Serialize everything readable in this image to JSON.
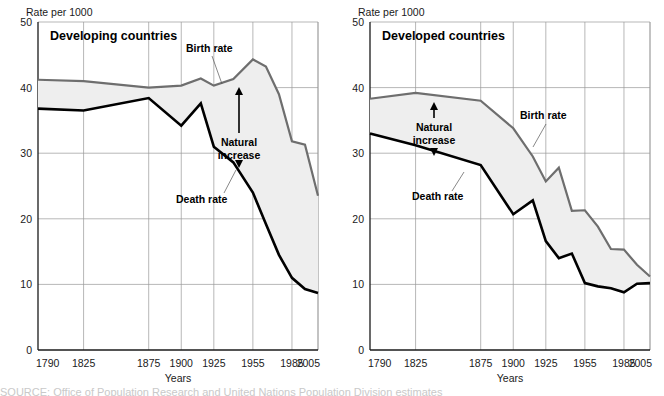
{
  "figure": {
    "background_color": "#ffffff",
    "birth_color": "#6e6e6e",
    "death_color": "#000000",
    "fill_color": "#eeeeee",
    "grid_color": "#9a9a9a",
    "axis_color": "#1a1a1a"
  },
  "chart_data": [
    {
      "type": "line",
      "panel_id": "developing",
      "title": "Developing countries",
      "ylabel": "Rate per 1000",
      "xlabel": "Years",
      "ylim": [
        0,
        50
      ],
      "yticks": [
        0,
        10,
        20,
        30,
        40,
        50
      ],
      "ytick_labels": [
        "0",
        "10",
        "20",
        "30",
        "40",
        "50"
      ],
      "xticks": [
        1790,
        1825,
        1875,
        1900,
        1925,
        1955,
        1985,
        2005
      ],
      "xtick_labels": [
        "1790",
        "1825",
        "1875",
        "1900",
        "1925",
        "1955",
        "1985",
        "2005"
      ],
      "xlim": [
        1790,
        2005
      ],
      "grid": true,
      "legend_position": "inline-annotations",
      "annotations": [
        {
          "name": "birth-rate-label",
          "text": "Birth rate"
        },
        {
          "name": "death-rate-label",
          "text": "Death rate"
        },
        {
          "name": "natural-increase-label",
          "text": "Natural\nincrease"
        }
      ],
      "series": [
        {
          "name": "Birth rate",
          "color": "#6e6e6e",
          "x": [
            1790,
            1825,
            1875,
            1900,
            1915,
            1925,
            1940,
            1955,
            1965,
            1975,
            1985,
            1995,
            2005
          ],
          "values": [
            41.2,
            41.0,
            40.0,
            40.3,
            41.4,
            40.3,
            41.3,
            44.3,
            43.2,
            39.0,
            31.8,
            31.3,
            23.5
          ]
        },
        {
          "name": "Death rate",
          "color": "#000000",
          "x": [
            1790,
            1825,
            1875,
            1900,
            1915,
            1925,
            1940,
            1955,
            1965,
            1975,
            1985,
            1995,
            2005
          ],
          "values": [
            36.8,
            36.5,
            38.4,
            34.2,
            37.6,
            31.0,
            28.6,
            24.0,
            19.2,
            14.5,
            11.0,
            9.3,
            8.7
          ]
        }
      ]
    },
    {
      "type": "line",
      "panel_id": "developed",
      "title": "Developed countries",
      "ylabel": "Rate per 1000",
      "xlabel": "Years",
      "ylim": [
        0,
        50
      ],
      "yticks": [
        0,
        10,
        20,
        30,
        40,
        50
      ],
      "ytick_labels": [
        "0",
        "10",
        "20",
        "30",
        "40",
        "50"
      ],
      "xticks": [
        1790,
        1825,
        1875,
        1900,
        1925,
        1955,
        1985,
        2005
      ],
      "xtick_labels": [
        "1790",
        "1825",
        "1875",
        "1900",
        "1925",
        "1955",
        "1985",
        "2005"
      ],
      "xlim": [
        1790,
        2005
      ],
      "grid": true,
      "legend_position": "inline-annotations",
      "annotations": [
        {
          "name": "birth-rate-label",
          "text": "Birth rate"
        },
        {
          "name": "death-rate-label",
          "text": "Death rate"
        },
        {
          "name": "natural-increase-label",
          "text": "Natural\nincrease"
        }
      ],
      "series": [
        {
          "name": "Birth rate",
          "color": "#6e6e6e",
          "x": [
            1790,
            1825,
            1875,
            1900,
            1915,
            1925,
            1935,
            1945,
            1955,
            1965,
            1975,
            1985,
            1995,
            2005
          ],
          "values": [
            38.3,
            39.2,
            38.0,
            33.8,
            29.5,
            25.7,
            27.8,
            21.2,
            21.3,
            18.8,
            15.4,
            15.3,
            13.0,
            11.2
          ]
        },
        {
          "name": "Death rate",
          "color": "#000000",
          "x": [
            1790,
            1825,
            1875,
            1900,
            1915,
            1925,
            1935,
            1945,
            1955,
            1965,
            1975,
            1985,
            1995,
            2005
          ],
          "values": [
            33.0,
            31.2,
            28.2,
            20.7,
            22.8,
            16.6,
            14.0,
            14.7,
            10.2,
            9.7,
            9.4,
            8.8,
            10.1,
            10.2
          ]
        }
      ]
    }
  ],
  "bottom_text": {
    "clipped_caption": "SOURCE: Office of Population Research and United Nations Population Division estimates"
  }
}
